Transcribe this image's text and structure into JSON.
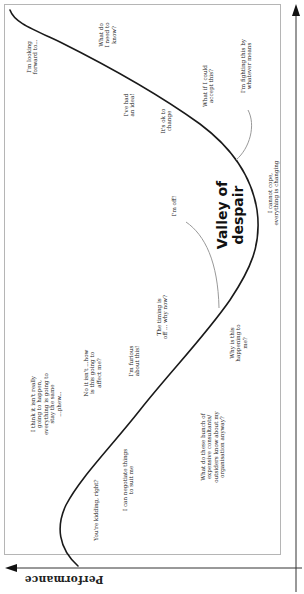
{
  "diagram": {
    "title": "Valley of despair",
    "axes": {
      "y_label": "Performance",
      "x_label": ""
    },
    "colors": {
      "curve": "#1a1a1a",
      "connector": "#999999",
      "frame": "#b5b5b5",
      "text": "#222222"
    },
    "labels": [
      {
        "id": "looking-forward",
        "text": "I'm looking\nforward to..."
      },
      {
        "id": "what-need-know",
        "text": "What do\nI need to\nknow?"
      },
      {
        "id": "had-idea",
        "text": "I've had\nan idea!"
      },
      {
        "id": "ok-change",
        "text": "It's ok to\nchange"
      },
      {
        "id": "could-accept",
        "text": "What if I could\naccept this?"
      },
      {
        "id": "fighting",
        "text": "I'm fighting this by\nwhatever means"
      },
      {
        "id": "im-off",
        "text": "I'm off!"
      },
      {
        "id": "cannot-cope",
        "text": "I cannot cope,\neverything is changing"
      },
      {
        "id": "timing-off",
        "text": "The timing is\noff ... why now?"
      },
      {
        "id": "why-happening",
        "text": "Why is this\nhappening to\nme?"
      },
      {
        "id": "furious",
        "text": "I'm furious\nabout this!"
      },
      {
        "id": "no-it-isnt",
        "text": "No it isn't ...how\nis this going to\naffect me?"
      },
      {
        "id": "consultants",
        "text": "What do these bunch of\nexpensive consultants/\noutsiders know about my\norganisation anyway?"
      },
      {
        "id": "think-isnt",
        "text": "I think it isn't really\ngoing to happen,\neverything is going to\nstay the same\n...phew..."
      },
      {
        "id": "negotiate",
        "text": "I can negotiate things\nto suit me"
      },
      {
        "id": "kidding",
        "text": "You're kidding, right?"
      }
    ]
  }
}
